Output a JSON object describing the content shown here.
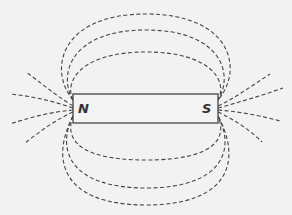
{
  "diagram": {
    "magnet": {
      "north_label": "N",
      "south_label": "S",
      "x": 73,
      "y": 94,
      "width": 145,
      "height": 29
    },
    "colors": {
      "background": "#f2f2f2",
      "line": "#444444",
      "magnet_fill": "#f4f4f4"
    },
    "field_lines": {
      "upper_loops": 3,
      "lower_loops": 3,
      "left_spray_lines": 4,
      "right_spray_lines": 4,
      "style": "dashed"
    }
  }
}
